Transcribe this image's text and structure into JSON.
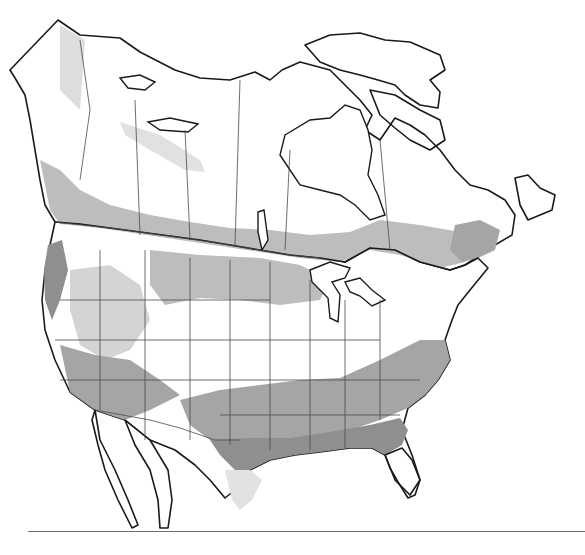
{
  "map": {
    "subject": "North America zone map (Canada, United States, northern Mexico)",
    "has_text_labels": false,
    "tones": {
      "background": "#ffffff",
      "zone_lightest": "#f4f4f4",
      "zone_light": "#e2e2e2",
      "zone_mid_light": "#d4d4d4",
      "zone_mid": "#bdbdbd",
      "zone_dark": "#a5a5a5",
      "zone_darkest": "#8f8f8f",
      "coastline": "#1a1a1a",
      "boundary": "#4a4a4a",
      "rule": "#6e6e6e"
    },
    "regions": [
      {
        "name": "northern-canada",
        "tone": "zone_light"
      },
      {
        "name": "pacific-northwest-coast",
        "tone": "zone_darkest"
      },
      {
        "name": "northern-us-plains",
        "tone": "zone_mid"
      },
      {
        "name": "central-us",
        "tone": "zone_lightest"
      },
      {
        "name": "southern-us",
        "tone": "zone_dark"
      },
      {
        "name": "gulf-coast",
        "tone": "zone_darkest"
      },
      {
        "name": "florida",
        "tone": "zone_mid_light"
      },
      {
        "name": "baja-california",
        "tone": "background"
      }
    ],
    "bottom_rule": {
      "y": 531,
      "x_start": 28,
      "x_end": 585
    }
  }
}
